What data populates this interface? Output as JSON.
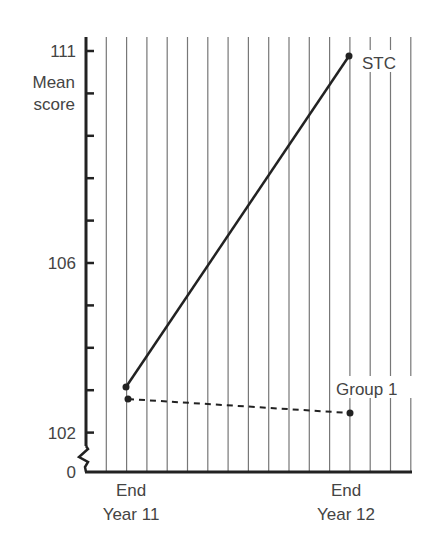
{
  "chart_data": {
    "type": "line",
    "title": "",
    "xlabel": "",
    "ylabel": "Mean score",
    "categories": [
      "End Year 11",
      "End Year 12"
    ],
    "x_tick_labels": [
      [
        "End",
        "Year 11"
      ],
      [
        "End",
        "Year 12"
      ]
    ],
    "y_tick_labels": [
      "111",
      "106",
      "102",
      "0"
    ],
    "ylim": [
      102,
      111
    ],
    "y_axis_break": true,
    "y_axis_zero_label": "0",
    "grid": {
      "vertical": true,
      "horizontal": false
    },
    "series": [
      {
        "name": "STC",
        "values": [
          103.1,
          110.9
        ],
        "style": "solid",
        "color": "#222222"
      },
      {
        "name": "Group 1",
        "values": [
          102.8,
          102.5
        ],
        "style": "dashed",
        "color": "#222222"
      }
    ],
    "legend": "inline labels at line ends"
  },
  "labels": {
    "ylabel_line1": "Mean",
    "ylabel_line2": "score",
    "tick_111": "111",
    "tick_106": "106",
    "tick_102": "102",
    "tick_0": "0",
    "x1_line1": "End",
    "x1_line2": "Year 11",
    "x2_line1": "End",
    "x2_line2": "Year 12",
    "series_stc": "STC",
    "series_group1": "Group 1"
  }
}
